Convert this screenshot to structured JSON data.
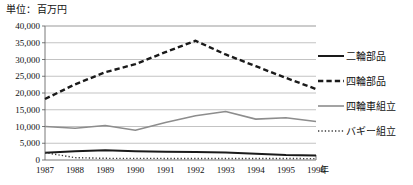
{
  "chart_data": {
    "type": "line",
    "title": "単位：百万円",
    "xlabel": "年",
    "ylabel": "",
    "categories": [
      "1987",
      "1988",
      "1989",
      "1990",
      "1991",
      "1992",
      "1993",
      "1994",
      "1995",
      "1996"
    ],
    "x_tick_labels": [
      "1987",
      "1988",
      "1989",
      "1990",
      "1991",
      "1992",
      "1993",
      "1994",
      "1995",
      "1996"
    ],
    "y_tick_labels": [
      "0",
      "5,000",
      "10,000",
      "15,000",
      "20,000",
      "25,000",
      "30,000",
      "35,000",
      "40,000"
    ],
    "y_tick_values": [
      0,
      5000,
      10000,
      15000,
      20000,
      25000,
      30000,
      35000,
      40000
    ],
    "ylim": [
      0,
      40000
    ],
    "grid": true,
    "legend_position": "right",
    "series": [
      {
        "name": "二輪部品",
        "style": "solid",
        "color": "#1a1a1a",
        "width": 2.0,
        "values": [
          2200,
          2600,
          2900,
          2600,
          2450,
          2400,
          2250,
          1900,
          1500,
          1350
        ]
      },
      {
        "name": "四輪部品",
        "style": "dashed",
        "color": "#1a1a1a",
        "width": 2.4,
        "values": [
          18200,
          22600,
          26200,
          28600,
          32200,
          35600,
          31500,
          28000,
          24500,
          21200
        ]
      },
      {
        "name": "四輪車組立",
        "style": "solid",
        "color": "#8d8d8d",
        "width": 1.6,
        "values": [
          10000,
          9500,
          10300,
          8900,
          11200,
          13200,
          14500,
          12200,
          12600,
          11500
        ]
      },
      {
        "name": "バギー組立",
        "style": "dotted",
        "color": "#3a3a3a",
        "width": 1.4,
        "values": [
          2200,
          700,
          500,
          480,
          470,
          460,
          450,
          440,
          430,
          420
        ]
      }
    ]
  },
  "legend": {
    "items": [
      {
        "label": "二輪部品"
      },
      {
        "label": "四輪部品"
      },
      {
        "label": "四輪車組立"
      },
      {
        "label": "バギー組立"
      }
    ]
  }
}
